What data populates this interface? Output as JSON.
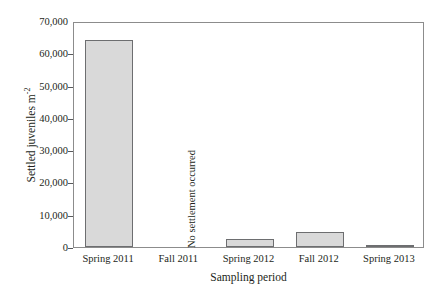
{
  "chart_data": {
    "type": "bar",
    "title": "",
    "xlabel": "Sampling period",
    "ylabel_text": "Settled juveniles m",
    "ylabel_exponent": "-2",
    "categories": [
      "Spring 2011",
      "Fall 2011",
      "Spring 2012",
      "Fall 2012",
      "Spring 2013"
    ],
    "values": [
      64200,
      0,
      2500,
      4700,
      600
    ],
    "ytick_labels": [
      "0",
      "10,000",
      "20,000",
      "30,000",
      "40,000",
      "50,000",
      "60,000",
      "70,000"
    ],
    "ytick_values": [
      0,
      10000,
      20000,
      30000,
      40000,
      50000,
      60000,
      70000
    ],
    "ylim": [
      0,
      70000
    ],
    "grid": false,
    "legend": false,
    "annotations": [
      {
        "text": "No settlement occurred",
        "category": "Fall 2011",
        "rotation": -90
      }
    ],
    "colors": {
      "bar_fill": "#d9d9d9",
      "bar_edge": "#6d6e70",
      "axis": "#8c8c8c",
      "text": "#231f20",
      "background": "#ffffff"
    }
  }
}
